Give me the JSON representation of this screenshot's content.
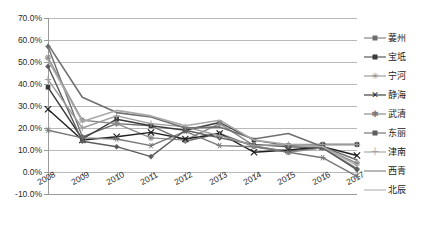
{
  "chart_data": {
    "type": "line",
    "title": "",
    "xlabel": "",
    "ylabel": "",
    "categories": [
      "2008",
      "2009",
      "2010",
      "2011",
      "2012",
      "2013",
      "2014",
      "2015",
      "2016",
      "2017"
    ],
    "ylim": [
      -10,
      70
    ],
    "ytick_step": 10,
    "ytick_labels": [
      "70.0%",
      "60.0%",
      "50.0%",
      "40.0%",
      "30.0%",
      "20.0%",
      "10.0%",
      "0.0%",
      "-10.0%"
    ],
    "ytick_values": [
      70,
      60,
      50,
      40,
      30,
      20,
      10,
      0,
      -10
    ],
    "grid": "horizontal",
    "legend_position": "right",
    "value_unit": "percent",
    "series": [
      {
        "name": "葁州",
        "marker": "diamond",
        "color": "#6e6e6e",
        "values": [
          57.0,
          16.0,
          22.0,
          21.0,
          14.0,
          17.5,
          11.5,
          9.5,
          11.0,
          1.5
        ]
      },
      {
        "name": "宝坻",
        "marker": "square",
        "color": "#3a3a3a",
        "values": [
          38.5,
          15.0,
          24.0,
          21.0,
          19.0,
          22.5,
          14.5,
          12.0,
          12.5,
          12.5
        ]
      },
      {
        "name": "宁河",
        "marker": "star",
        "color": "#8a8a8a",
        "values": [
          52.0,
          23.5,
          22.0,
          15.5,
          14.5,
          22.0,
          12.0,
          9.0,
          11.0,
          4.0
        ]
      },
      {
        "name": "静海",
        "marker": "x",
        "color": "#1f1f1f",
        "values": [
          28.5,
          14.5,
          16.0,
          18.0,
          15.0,
          17.5,
          9.0,
          10.0,
          11.5,
          7.5
        ]
      },
      {
        "name": "武清",
        "marker": "asterisk",
        "color": "#777777",
        "values": [
          19.0,
          15.5,
          15.0,
          12.0,
          18.5,
          12.0,
          11.5,
          9.0,
          6.5,
          -2.0
        ]
      },
      {
        "name": "东丽",
        "marker": "diamond",
        "color": "#5c5c5c",
        "values": [
          48.0,
          14.0,
          11.5,
          7.0,
          19.0,
          15.5,
          12.5,
          11.5,
          11.0,
          1.0
        ]
      },
      {
        "name": "津南",
        "marker": "plus",
        "color": "#9b9b9b",
        "values": [
          42.0,
          20.0,
          25.5,
          22.0,
          20.5,
          16.5,
          12.0,
          12.5,
          12.5,
          12.5
        ]
      },
      {
        "name": "西青",
        "marker": "none",
        "color": "#707070",
        "values": [
          58.0,
          34.0,
          27.0,
          25.0,
          20.0,
          20.5,
          15.0,
          17.5,
          11.5,
          5.5
        ]
      },
      {
        "name": "北辰",
        "marker": "none",
        "color": "#a8a8a8",
        "values": [
          51.0,
          23.0,
          28.0,
          25.5,
          21.0,
          23.5,
          14.5,
          12.5,
          11.5,
          3.0
        ]
      }
    ]
  },
  "legend": {
    "items": [
      {
        "label": "葁州",
        "marker": "diamond-marker"
      },
      {
        "label": "宝坻",
        "marker": "square-marker"
      },
      {
        "label": "宁河",
        "marker": "star-marker"
      },
      {
        "label": "静海",
        "marker": "x-marker"
      },
      {
        "label": "武清",
        "marker": "asterisk-marker"
      },
      {
        "label": "东丽",
        "marker": "diamond-marker"
      },
      {
        "label": "津南",
        "marker": "plus-marker"
      },
      {
        "label": "西青",
        "marker": "line-only"
      },
      {
        "label": "北辰",
        "marker": "line-only"
      }
    ]
  },
  "colors": {
    "plot_background": "#ffffff",
    "gridline": "#b9b9b9",
    "axis": "#9a9a9a",
    "text": "#2b2b2b"
  }
}
